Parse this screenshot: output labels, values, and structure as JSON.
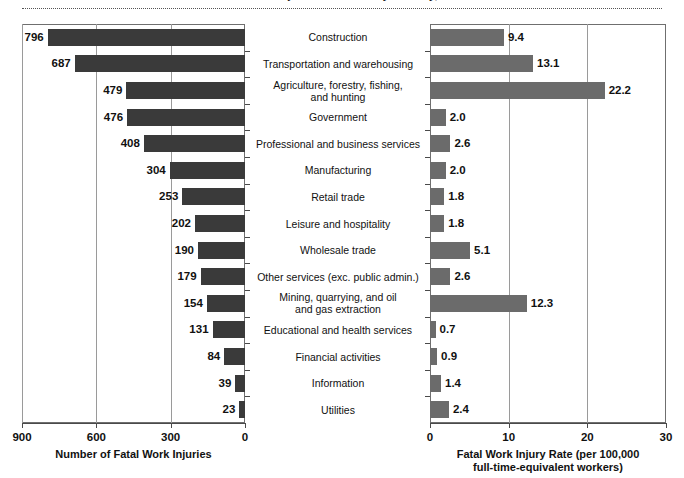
{
  "figure": {
    "clipped_title": "Fatal Work Injuries and Rates by Industry, 2019"
  },
  "chart_data": {
    "type": "bar",
    "title": "Fatal Work Injuries and Rates by Industry, 2019",
    "orientation": "horizontal",
    "panels": 2,
    "categories": [
      "Construction",
      "Transportation and warehousing",
      "Agriculture, forestry, fishing,\nand hunting",
      "Government",
      "Professional and business services",
      "Manufacturing",
      "Retail trade",
      "Leisure and hospitality",
      "Wholesale trade",
      "Other services (exc. public admin.)",
      "Mining, quarrying, and oil\nand gas extraction",
      "Educational and health services",
      "Financial activities",
      "Information",
      "Utilities"
    ],
    "series": [
      {
        "name": "Number of Fatal Work Injuries",
        "panel": "left",
        "xlabel": "Number of Fatal Work Injuries",
        "ylabel": "",
        "xlim": [
          900,
          0
        ],
        "reversed": true,
        "ticks": [
          900,
          600,
          300,
          0
        ],
        "tick_labels": [
          "900",
          "600",
          "300",
          "0"
        ],
        "grid": true,
        "color": "#3a3a3a",
        "values": [
          796,
          687,
          479,
          476,
          408,
          304,
          253,
          202,
          190,
          179,
          154,
          131,
          84,
          39,
          23
        ],
        "value_labels": [
          "796",
          "687",
          "479",
          "476",
          "408",
          "304",
          "253",
          "202",
          "190",
          "179",
          "154",
          "131",
          "84",
          "39",
          "23"
        ]
      },
      {
        "name": "Fatal Work Injury Rate (per 100,000 full-time-equivalent workers)",
        "panel": "right",
        "xlabel": "Fatal Work Injury Rate (per 100,000\nfull-time-equivalent workers)",
        "xlabel_line1": "Fatal Work Injury Rate (per 100,000",
        "xlabel_line2": "full-time-equivalent workers)",
        "ylabel": "",
        "xlim": [
          0,
          30
        ],
        "reversed": false,
        "ticks": [
          0,
          10,
          20,
          30
        ],
        "tick_labels": [
          "0",
          "10",
          "20",
          "30"
        ],
        "grid": true,
        "color": "#6b6b6b",
        "values": [
          9.4,
          13.1,
          22.2,
          2.0,
          2.6,
          2.0,
          1.8,
          1.8,
          5.1,
          2.6,
          12.3,
          0.7,
          0.9,
          1.4,
          2.4
        ],
        "value_labels": [
          "9.4",
          "13.1",
          "22.2",
          "2.0",
          "2.6",
          "2.0",
          "1.8",
          "1.8",
          "5.1",
          "2.6",
          "12.3",
          "0.7",
          "0.9",
          "1.4",
          "2.4"
        ]
      }
    ],
    "left_axis_title": "Number of Fatal Work Injuries",
    "right_axis_title_line1": "Fatal Work Injury Rate (per 100,000",
    "right_axis_title_line2": "full-time-equivalent workers)"
  }
}
